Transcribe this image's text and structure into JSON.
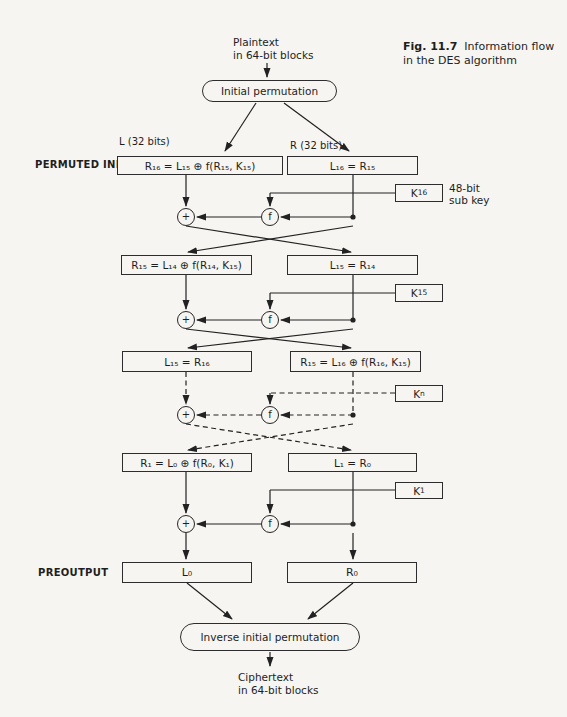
{
  "figure": {
    "fig_label": "Fig. 11.7",
    "caption_line1": "Information flow",
    "caption_line2": "in the DES algorithm"
  },
  "top": {
    "input_line1": "Plaintext",
    "input_line2": "in 64-bit blocks",
    "initial_permutation": "Initial permutation",
    "left_register_label": "L (32 bits)",
    "right_register_label": "R (32 bits)",
    "permuted_input_label": "PERMUTED INPUT"
  },
  "operators": {
    "xor": "+",
    "f": "f"
  },
  "rounds": [
    {
      "left_box": "R₁₆ = L₁₅ ⊕ f(R₁₅, K₁₅)",
      "right_box": "L₁₆ = R₁₅",
      "key": {
        "base": "K",
        "sub": "16"
      },
      "key_note_line1": "48-bit",
      "key_note_line2": "sub key"
    },
    {
      "left_box": "R₁₅ = L₁₄ ⊕ f(R₁₄, K₁₅)",
      "right_box": "L₁₅ = R₁₄",
      "key": {
        "base": "K",
        "sub": "15"
      }
    },
    {
      "left_box": "L₁₅ = R₁₆",
      "right_box": "R₁₅ = L₁₆ ⊕ f(R₁₆, K₁₅)",
      "key": {
        "base": "K",
        "sub": "n"
      }
    },
    {
      "left_box": "R₁ = L₀ ⊕ f(R₀, K₁)",
      "right_box": "L₁ = R₀",
      "key": {
        "base": "K",
        "sub": "1"
      }
    }
  ],
  "bottom": {
    "preoutput_label": "PREOUTPUT",
    "left_box": "L₀",
    "right_box": "R₀",
    "inverse_permutation": "Inverse initial permutation",
    "output_line1": "Ciphertext",
    "output_line2": "in 64-bit blocks"
  }
}
